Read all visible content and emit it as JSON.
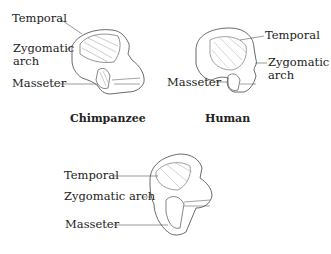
{
  "panels": [
    {
      "caption": "Chimpanzee",
      "labels": {
        "temporal": "Temporal",
        "zygomatic": "Zygomatic",
        "zygomatic2": "arch",
        "masseter": "Masseter"
      }
    },
    {
      "caption": "Human",
      "labels": {
        "temporal": "Temporal",
        "zygomatic": "Zygomatic",
        "zygomatic2": "arch",
        "masseter": "Masseter"
      }
    },
    {
      "caption": "",
      "labels": {
        "temporal": "Temporal",
        "zygomatic": "Zygomatic arch",
        "masseter": "Masseter"
      }
    }
  ],
  "colors": {
    "line": "#444444",
    "muscle": "#777777",
    "text": "#222222"
  }
}
